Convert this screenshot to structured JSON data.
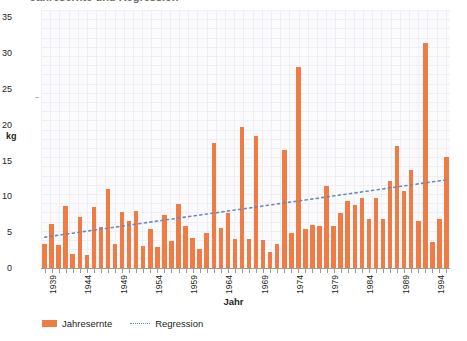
{
  "title_partial": "Jahresernte und Regression",
  "axis": {
    "y_label": "kg",
    "x_label": "Jahr",
    "y_ticks": [
      0,
      5,
      10,
      15,
      20,
      25,
      30,
      35
    ],
    "x_ticks": [
      1939,
      1944,
      1949,
      1954,
      1959,
      1964,
      1969,
      1974,
      1979,
      1984,
      1989,
      1994
    ]
  },
  "legend": {
    "bars_label": "Jahresernte",
    "line_label": "Regression"
  },
  "colors": {
    "bar": "#ef7b45",
    "regression": "#6d8bb5",
    "grid": "#eceef4",
    "plot_bg": "#fbfbfd",
    "axis": "#9b9b9b",
    "text": "#231f20"
  },
  "chart_data": {
    "type": "bar",
    "title": "Jahresernte und Regression",
    "xlabel": "Jahr",
    "ylabel": "kg",
    "ylim": [
      0,
      36
    ],
    "grid": true,
    "legend_position": "bottom-left",
    "categories": [
      1939,
      1940,
      1941,
      1942,
      1943,
      1944,
      1945,
      1946,
      1947,
      1948,
      1949,
      1950,
      1951,
      1952,
      1953,
      1954,
      1955,
      1956,
      1957,
      1958,
      1959,
      1960,
      1961,
      1962,
      1963,
      1964,
      1965,
      1966,
      1967,
      1968,
      1969,
      1970,
      1971,
      1972,
      1973,
      1974,
      1975,
      1976,
      1977,
      1978,
      1979,
      1980,
      1981,
      1982,
      1983,
      1984,
      1985,
      1986,
      1987,
      1988,
      1989,
      1990,
      1991,
      1992,
      1993,
      1994,
      1995,
      1996
    ],
    "series": [
      {
        "name": "Jahresernte",
        "type": "bar",
        "values": [
          3.4,
          6.2,
          3.2,
          8.6,
          1.9,
          7.1,
          1.8,
          8.5,
          5.7,
          11.0,
          3.3,
          7.8,
          6.5,
          7.9,
          3.1,
          5.4,
          3.0,
          7.4,
          3.8,
          8.9,
          5.9,
          4.2,
          2.6,
          4.9,
          17.5,
          5.6,
          7.7,
          4.1,
          19.7,
          4.0,
          18.4,
          3.9,
          2.2,
          3.3,
          16.4,
          4.9,
          28.0,
          5.5,
          6.0,
          5.8,
          11.5,
          5.8,
          7.7,
          9.3,
          8.8,
          9.7,
          6.9,
          9.8,
          6.8,
          12.1,
          17.0,
          10.8,
          13.7,
          6.5,
          31.4,
          3.6,
          6.9,
          15.5
        ]
      },
      {
        "name": "Regression",
        "type": "line",
        "style": "dotted",
        "endpoints": {
          "x_start": 1939,
          "y_start": 4.3,
          "x_end": 1996,
          "y_end": 12.3
        }
      }
    ]
  }
}
